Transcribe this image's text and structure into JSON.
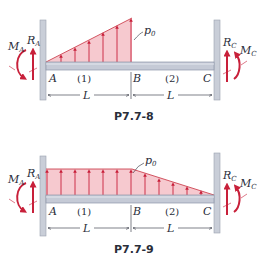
{
  "colors": {
    "load_fill": "#f6c9cf",
    "load_stroke": "#c8303f",
    "arrow": "#c8203a",
    "beam_fill": "#c5cad6",
    "beam_stroke": "#8e96a8",
    "wall_fill": "#c9ced8",
    "wall_stroke": "#9aa1b0",
    "text": "#2a2e3a"
  },
  "diagrams": [
    {
      "caption": "P7.7-8",
      "load_type": "triangular increasing from A to B, zero on BC",
      "load_label": "p",
      "load_label_sub": "0",
      "points": [
        "A",
        "B",
        "C"
      ],
      "segments": [
        "(1)",
        "(2)"
      ],
      "lengths": [
        "L",
        "L"
      ],
      "left_reaction": {
        "force": "R",
        "force_sub": "A",
        "moment": "M",
        "moment_sub": "A"
      },
      "right_reaction": {
        "force": "R",
        "force_sub": "C",
        "moment": "M",
        "moment_sub": "C"
      }
    },
    {
      "caption": "P7.7-9",
      "load_type": "uniform on AB, linearly decreasing to zero on BC",
      "load_label": "p",
      "load_label_sub": "0",
      "points": [
        "A",
        "B",
        "C"
      ],
      "segments": [
        "(1)",
        "(2)"
      ],
      "lengths": [
        "L",
        "L"
      ],
      "left_reaction": {
        "force": "R",
        "force_sub": "A",
        "moment": "M",
        "moment_sub": "A"
      },
      "right_reaction": {
        "force": "R",
        "force_sub": "C",
        "moment": "M",
        "moment_sub": "C"
      }
    }
  ]
}
